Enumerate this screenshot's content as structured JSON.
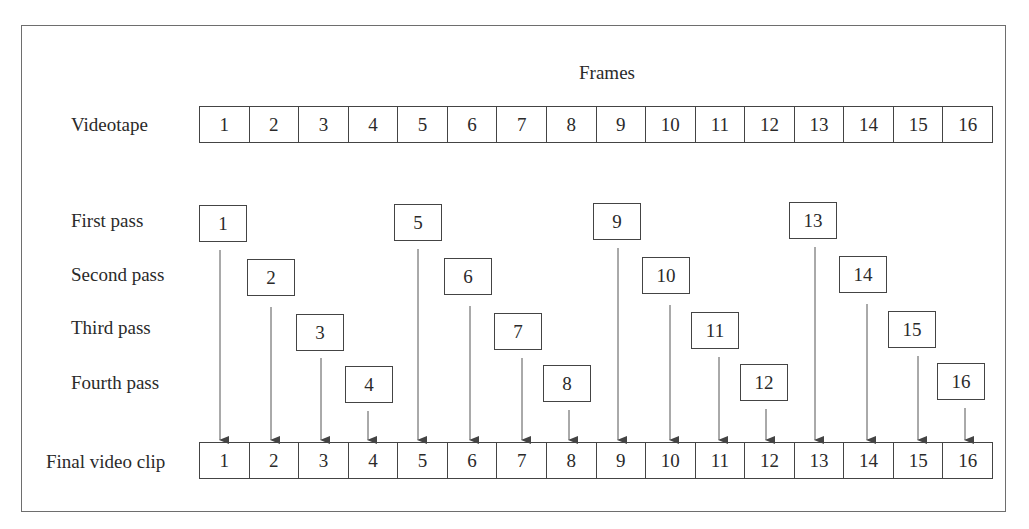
{
  "diagram": {
    "title": "Frames",
    "rows": {
      "videotape": {
        "label": "Videotape",
        "frames": [
          "1",
          "2",
          "3",
          "4",
          "5",
          "6",
          "7",
          "8",
          "9",
          "10",
          "11",
          "12",
          "13",
          "14",
          "15",
          "16"
        ]
      },
      "passes": [
        {
          "label": "First pass",
          "frames": [
            "1",
            "5",
            "9",
            "13"
          ]
        },
        {
          "label": "Second pass",
          "frames": [
            "2",
            "6",
            "10",
            "14"
          ]
        },
        {
          "label": "Third pass",
          "frames": [
            "3",
            "7",
            "11",
            "15"
          ]
        },
        {
          "label": "Fourth pass",
          "frames": [
            "4",
            "8",
            "12",
            "16"
          ]
        }
      ],
      "final": {
        "label": "Final video clip",
        "frames": [
          "1",
          "2",
          "3",
          "4",
          "5",
          "6",
          "7",
          "8",
          "9",
          "10",
          "11",
          "12",
          "13",
          "14",
          "15",
          "16"
        ]
      }
    },
    "colors": {
      "line": "#444444",
      "frame_border": "#6e6e6e",
      "text": "#2a2a2a",
      "background": "#ffffff"
    }
  }
}
